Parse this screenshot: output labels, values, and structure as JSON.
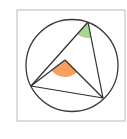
{
  "diagram": {
    "type": "inscribed-angle-geometry",
    "canvas": {
      "width": 127,
      "height": 139,
      "background": "#ffffff"
    },
    "frame": {
      "x": 17,
      "y": 10,
      "width": 108,
      "height": 111,
      "stroke": "#b8b8b8"
    },
    "circle": {
      "cx": 72,
      "cy": 65.5,
      "r": 46,
      "stroke": "#3a3a3a"
    },
    "center_point": {
      "x": 65,
      "y": 60
    },
    "vertices": {
      "top": {
        "x": 88,
        "y": 22
      },
      "left": {
        "x": 31,
        "y": 86
      },
      "bottom_right": {
        "x": 103,
        "y": 98
      }
    },
    "angles": {
      "inscribed": {
        "vertex": "top",
        "color": "#a8d890",
        "radius": 16
      },
      "central": {
        "vertex": "center",
        "color": "#f5a060",
        "radius": 17
      }
    },
    "line_color": "#2e2e2e"
  }
}
